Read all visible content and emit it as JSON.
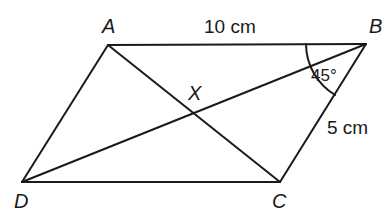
{
  "figure": {
    "type": "parallelogram",
    "vertices": {
      "A": {
        "label": "A",
        "x": 108,
        "y": 45
      },
      "B": {
        "label": "B",
        "x": 366,
        "y": 44
      },
      "C": {
        "label": "C",
        "x": 280,
        "y": 182
      },
      "D": {
        "label": "D",
        "x": 22,
        "y": 182
      }
    },
    "intersection": {
      "label": "X",
      "x": 192,
      "y": 110
    },
    "measurements": {
      "AB": "10 cm",
      "BC": "5 cm"
    },
    "angle": {
      "vertex": "B",
      "between": [
        "BA",
        "BD"
      ],
      "label": "45°"
    },
    "edges": [
      "AB",
      "BC",
      "CD",
      "DA"
    ],
    "diagonals": [
      "AC",
      "BD"
    ]
  }
}
